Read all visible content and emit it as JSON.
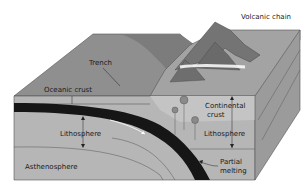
{
  "diagram": {
    "type": "block-diagram",
    "labels": {
      "volcanic_chain": "Volcanic chain",
      "trench": "Trench",
      "oceanic_crust": "Oceanic crust",
      "continental_crust_line1": "Continental",
      "continental_crust_line2": "crust",
      "lithosphere_left": "Lithosphere",
      "lithosphere_right": "Lithosphere",
      "asthenosphere": "Asthenosphere",
      "partial_melting_line1": "Partial",
      "partial_melting_line2": "melting"
    },
    "colors": {
      "ocean_floor": "#8e8e8e",
      "front_face": "#b4b4b4",
      "side_face": "#9a9a9a",
      "slab": "#141414",
      "continent": "#bdbdbd",
      "mountains": "#7a7a7a"
    }
  }
}
